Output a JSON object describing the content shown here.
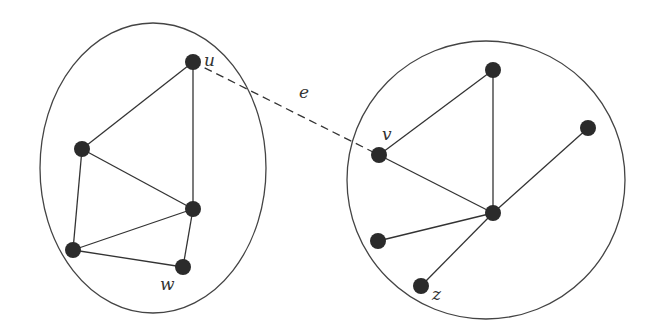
{
  "diagram": {
    "type": "graph",
    "components": [
      {
        "id": "left",
        "shape": "ellipse",
        "cx": 153,
        "cy": 168,
        "rx": 113,
        "ry": 145,
        "nodes": [
          {
            "id": "u",
            "label": "u",
            "x": 193,
            "y": 62,
            "lx": 204,
            "ly": 66
          },
          {
            "id": "L1",
            "label": "",
            "x": 82,
            "y": 149
          },
          {
            "id": "L2",
            "label": "",
            "x": 193,
            "y": 209
          },
          {
            "id": "L3",
            "label": "",
            "x": 73,
            "y": 250
          },
          {
            "id": "w",
            "label": "w",
            "x": 183,
            "y": 267,
            "lx": 160,
            "ly": 290
          }
        ],
        "edges": [
          [
            "u",
            "L1"
          ],
          [
            "u",
            "L2"
          ],
          [
            "L1",
            "L2"
          ],
          [
            "L1",
            "L3"
          ],
          [
            "L3",
            "L2"
          ],
          [
            "L3",
            "w"
          ],
          [
            "L2",
            "w"
          ]
        ]
      },
      {
        "id": "right",
        "shape": "circle",
        "cx": 486,
        "cy": 180,
        "r": 139,
        "nodes": [
          {
            "id": "R1",
            "label": "",
            "x": 493,
            "y": 70
          },
          {
            "id": "v",
            "label": "v",
            "x": 379,
            "y": 155,
            "lx": 382,
            "ly": 140
          },
          {
            "id": "R2",
            "label": "",
            "x": 588,
            "y": 128
          },
          {
            "id": "R3",
            "label": "",
            "x": 493,
            "y": 213
          },
          {
            "id": "R4",
            "label": "",
            "x": 378,
            "y": 241
          },
          {
            "id": "z",
            "label": "z",
            "x": 421,
            "y": 286,
            "lx": 432,
            "ly": 300
          }
        ],
        "edges": [
          [
            "v",
            "R1"
          ],
          [
            "R1",
            "R3"
          ],
          [
            "v",
            "R3"
          ],
          [
            "R2",
            "R3"
          ],
          [
            "R4",
            "R3"
          ],
          [
            "z",
            "R3"
          ]
        ]
      }
    ],
    "bridge_edge": {
      "from": "u",
      "to": "v",
      "label": "e",
      "lx": 299,
      "ly": 98,
      "style": "dashed"
    }
  }
}
